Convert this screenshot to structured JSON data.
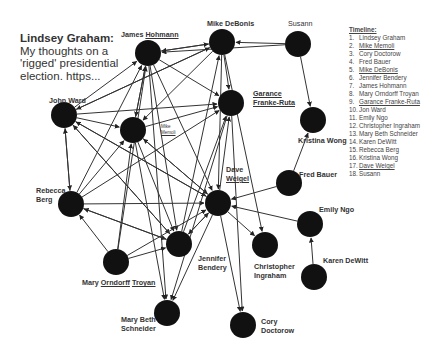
{
  "title": {
    "author": "Lindsey Graham:",
    "text": " My thoughts on a 'rigged' presidential election. https..."
  },
  "timeline": {
    "heading": "Timeline:",
    "items": [
      {
        "n": "1.",
        "name": "Lindsey Graham"
      },
      {
        "n": "2.",
        "name": "Mike Memoli"
      },
      {
        "n": "3.",
        "name": "Cory Doctorow"
      },
      {
        "n": "4.",
        "name": "Fred Bauer"
      },
      {
        "n": "5.",
        "name": "Mike DeBonis"
      },
      {
        "n": "6.",
        "name": "Jennifer Bendery"
      },
      {
        "n": "7.",
        "name": "James Hohmann"
      },
      {
        "n": "8.",
        "name": "Mary Orndorff Troyan"
      },
      {
        "n": "9.",
        "name": "Garance Franke-Ruta"
      },
      {
        "n": "10.",
        "name": "Jon Ward"
      },
      {
        "n": "11.",
        "name": "Emily Ngo"
      },
      {
        "n": "12.",
        "name": "Christopher Ingraham"
      },
      {
        "n": "13.",
        "name": "Mary Beth Schneider"
      },
      {
        "n": "14.",
        "name": "Karen DeWitt"
      },
      {
        "n": "15.",
        "name": "Rebecca Berg"
      },
      {
        "n": "16.",
        "name": "Kristina Wong"
      },
      {
        "n": "17.",
        "name": "Dave Weigel"
      },
      {
        "n": "18.",
        "name": "Susann"
      }
    ]
  },
  "nodes": [
    {
      "id": "hohmann",
      "label": "James Hohmann",
      "x": 148,
      "y": 53,
      "r": 13
    },
    {
      "id": "debonis",
      "label": "Mike DeBonis",
      "x": 222,
      "y": 42,
      "r": 13
    },
    {
      "id": "susann",
      "label": "Susann",
      "x": 298,
      "y": 44,
      "r": 13
    },
    {
      "id": "garance",
      "label": "Garance Franke-Ruta",
      "x": 231,
      "y": 103,
      "r": 13
    },
    {
      "id": "kristina",
      "label": "Kristina Wong",
      "x": 313,
      "y": 120,
      "r": 13
    },
    {
      "id": "johnward",
      "label": "John Ward",
      "x": 64,
      "y": 115,
      "r": 13
    },
    {
      "id": "memoli",
      "label": "Mike Memoli",
      "x": 133,
      "y": 130,
      "r": 13
    },
    {
      "id": "weigel",
      "label": "Dave Weigel",
      "x": 218,
      "y": 203,
      "r": 13
    },
    {
      "id": "fred",
      "label": "Fred Bauer",
      "x": 289,
      "y": 183,
      "r": 13
    },
    {
      "id": "rebecca",
      "label": "Rebecca Berg",
      "x": 71,
      "y": 204,
      "r": 13
    },
    {
      "id": "emily",
      "label": "Emily Ngo",
      "x": 310,
      "y": 224,
      "r": 13
    },
    {
      "id": "jennifer",
      "label": "Jennifer Bendery",
      "x": 179,
      "y": 244,
      "r": 13
    },
    {
      "id": "ingraham",
      "label": "Christopher Ingraham",
      "x": 265,
      "y": 245,
      "r": 13
    },
    {
      "id": "troyan",
      "label": "Mary Orndorff Troyan",
      "x": 116,
      "y": 262,
      "r": 13
    },
    {
      "id": "karen",
      "label": "Karen DeWitt",
      "x": 314,
      "y": 277,
      "r": 13
    },
    {
      "id": "schneider",
      "label": "Mary Beth Schneider",
      "x": 167,
      "y": 313,
      "r": 13
    },
    {
      "id": "cory",
      "label": "Cory Doctorow",
      "x": 243,
      "y": 325,
      "r": 13
    }
  ],
  "edges": [
    [
      "debonis",
      "hohmann"
    ],
    [
      "hohmann",
      "debonis"
    ],
    [
      "susann",
      "debonis"
    ],
    [
      "susann",
      "hohmann"
    ],
    [
      "susann",
      "kristina"
    ],
    [
      "debonis",
      "garance"
    ],
    [
      "debonis",
      "weigel"
    ],
    [
      "debonis",
      "ingraham"
    ],
    [
      "debonis",
      "memoli"
    ],
    [
      "debonis",
      "johnward"
    ],
    [
      "hohmann",
      "weigel"
    ],
    [
      "hohmann",
      "garance"
    ],
    [
      "hohmann",
      "jennifer"
    ],
    [
      "hohmann",
      "schneider"
    ],
    [
      "hohmann",
      "memoli"
    ],
    [
      "johnward",
      "hohmann"
    ],
    [
      "johnward",
      "debonis"
    ],
    [
      "johnward",
      "memoli"
    ],
    [
      "johnward",
      "garance"
    ],
    [
      "johnward",
      "rebecca"
    ],
    [
      "rebecca",
      "johnward"
    ],
    [
      "johnward",
      "weigel"
    ],
    [
      "johnward",
      "jennifer"
    ],
    [
      "memoli",
      "garance"
    ],
    [
      "memoli",
      "weigel"
    ],
    [
      "memoli",
      "jennifer"
    ],
    [
      "memoli",
      "schneider"
    ],
    [
      "memoli",
      "hohmann"
    ],
    [
      "rebecca",
      "hohmann"
    ],
    [
      "rebecca",
      "memoli"
    ],
    [
      "rebecca",
      "garance"
    ],
    [
      "rebecca",
      "weigel"
    ],
    [
      "rebecca",
      "jennifer"
    ],
    [
      "troyan",
      "rebecca"
    ],
    [
      "troyan",
      "jennifer"
    ],
    [
      "troyan",
      "weigel"
    ],
    [
      "troyan",
      "hohmann"
    ],
    [
      "troyan",
      "memoli"
    ],
    [
      "jennifer",
      "weigel"
    ],
    [
      "jennifer",
      "garance"
    ],
    [
      "jennifer",
      "debonis"
    ],
    [
      "jennifer",
      "johnward"
    ],
    [
      "jennifer",
      "rebecca"
    ],
    [
      "weigel",
      "jennifer"
    ],
    [
      "weigel",
      "ingraham"
    ],
    [
      "weigel",
      "schneider"
    ],
    [
      "weigel",
      "cory"
    ],
    [
      "weigel",
      "garance"
    ],
    [
      "weigel",
      "memoli"
    ],
    [
      "weigel",
      "johnward"
    ],
    [
      "fred",
      "weigel"
    ],
    [
      "fred",
      "kristina"
    ],
    [
      "emily",
      "weigel"
    ],
    [
      "karen",
      "emily"
    ],
    [
      "garance",
      "cory"
    ],
    [
      "garance",
      "schneider"
    ]
  ],
  "colors": {
    "node": "#111111",
    "edge": "#333333",
    "background": "#ffffff"
  }
}
